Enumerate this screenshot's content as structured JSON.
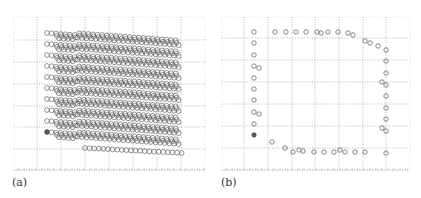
{
  "figure": {
    "panels": [
      {
        "id": "a",
        "label": "(a)"
      },
      {
        "id": "b",
        "label": "(b)"
      }
    ]
  },
  "chart_data": [
    {
      "type": "scatter",
      "title": "",
      "panel_label": "(a)",
      "xlabel": "",
      "ylabel": "",
      "grid": true,
      "grid_style": "dotted",
      "description": "Dense lattice of hollow circles arranged in 10 stacked layers; each layer is a band of circles sloping slightly downward to the right. One filled marker at the lower-left start of the bottom layer.",
      "layers": 10,
      "layer_spacing_px": 11,
      "row_start": {
        "x": 47,
        "y_top_layer": 33
      },
      "row_end": {
        "x": 182,
        "y_top_layer": 51
      },
      "marker": {
        "shape": "circle",
        "fill": "none",
        "stroke": "#666666",
        "radius": 2.4
      },
      "filled_marker": {
        "x": 47,
        "y": 132,
        "fill": "#555555"
      },
      "gridlines_x_px": [
        37,
        61,
        85,
        109,
        133,
        157,
        181
      ],
      "gridlines_y_px": [
        40,
        62,
        84,
        106,
        127,
        149
      ],
      "frame_px": {
        "left": 14,
        "right": 205,
        "top": 17,
        "bottom": 170
      }
    },
    {
      "type": "scatter",
      "title": "",
      "panel_label": "(b)",
      "xlabel": "",
      "ylabel": "",
      "grid": true,
      "grid_style": "dotted",
      "description": "Boundary points only: a closed rectangular-ish outline of hollow circles with one filled marker on the left edge.",
      "marker": {
        "shape": "circle",
        "fill": "none",
        "stroke": "#666666",
        "radius": 2.2
      },
      "filled_marker": {
        "x": 254,
        "y": 135,
        "fill": "#555555"
      },
      "points": [
        [
          254,
          32
        ],
        [
          275,
          32
        ],
        [
          286,
          32
        ],
        [
          296,
          32
        ],
        [
          306,
          32
        ],
        [
          317,
          32
        ],
        [
          321,
          33
        ],
        [
          328,
          32
        ],
        [
          338,
          32
        ],
        [
          348,
          33
        ],
        [
          353,
          35
        ],
        [
          365,
          41
        ],
        [
          370,
          43
        ],
        [
          378,
          46
        ],
        [
          386,
          50
        ],
        [
          254,
          43
        ],
        [
          254,
          55
        ],
        [
          254,
          66
        ],
        [
          259,
          68
        ],
        [
          254,
          78
        ],
        [
          254,
          89
        ],
        [
          254,
          100
        ],
        [
          254,
          112
        ],
        [
          259,
          114
        ],
        [
          254,
          124
        ],
        [
          386,
          61
        ],
        [
          386,
          73
        ],
        [
          382,
          82
        ],
        [
          386,
          85
        ],
        [
          386,
          96
        ],
        [
          386,
          108
        ],
        [
          386,
          119
        ],
        [
          382,
          128
        ],
        [
          386,
          131
        ],
        [
          386,
          153
        ],
        [
          272,
          142
        ],
        [
          285,
          148
        ],
        [
          293,
          152
        ],
        [
          299,
          150
        ],
        [
          303,
          151
        ],
        [
          314,
          152
        ],
        [
          324,
          152
        ],
        [
          334,
          152
        ],
        [
          340,
          150
        ],
        [
          345,
          152
        ],
        [
          355,
          152
        ],
        [
          365,
          152
        ]
      ],
      "gridlines_x_px": [
        244,
        268,
        292,
        315,
        339,
        363,
        386
      ],
      "gridlines_y_px": [
        38,
        60,
        82,
        104,
        126,
        148
      ],
      "frame_px": {
        "left": 222,
        "right": 410,
        "top": 17,
        "bottom": 170
      }
    }
  ]
}
